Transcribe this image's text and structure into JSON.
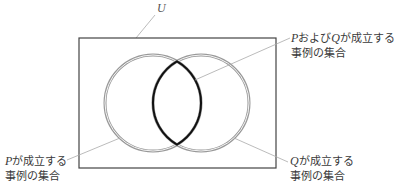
{
  "diagram": {
    "type": "venn",
    "universe_label": "U",
    "labels": {
      "intersection": {
        "var1": "P",
        "mid": "および",
        "var2": "Q",
        "tail": "が成立する",
        "line2": "事例の集合"
      },
      "set_p": {
        "var": "P",
        "tail": "が成立する",
        "line2": "事例の集合"
      },
      "set_q": {
        "var": "Q",
        "tail": "が成立する",
        "line2": "事例の集合"
      }
    },
    "colors": {
      "frame": "#444444",
      "circle_outline": "#999999",
      "intersection_outline": "#111111",
      "leader_line": "#999999"
    }
  }
}
